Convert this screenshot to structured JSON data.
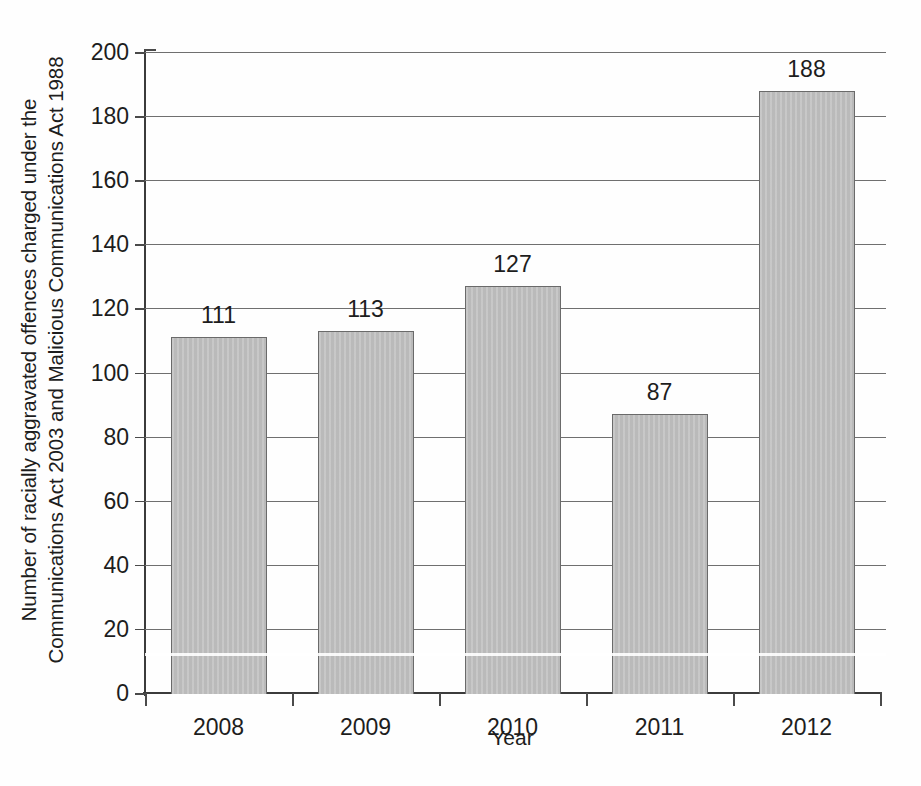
{
  "chart_data": {
    "type": "bar",
    "title": "",
    "categories": [
      "2008",
      "2009",
      "2010",
      "2011",
      "2012"
    ],
    "values": [
      111,
      113,
      127,
      87,
      188
    ],
    "data_labels": [
      "111",
      "113",
      "127",
      "87",
      "188"
    ],
    "xlabel": "Year",
    "ylabel_lines": [
      "Number of racially aggravated offences charged under the",
      "Communications Act 2003 and Malicious Communications Act 1988"
    ],
    "ylabel": "Number of racially aggravated offences charged under the Communications Act 2003 and Malicious Communications Act 1988",
    "ylim": [
      0,
      200
    ],
    "ytick_step": 20,
    "ytick_labels": [
      "0",
      "20",
      "40",
      "60",
      "80",
      "100",
      "120",
      "140",
      "160",
      "180",
      "200"
    ],
    "ytick_values": [
      0,
      20,
      40,
      60,
      80,
      100,
      120,
      140,
      160,
      180,
      200
    ],
    "grid": true,
    "grid_axis": "y",
    "legend": false,
    "legend_position": "none",
    "bar_color": "#bdbdbd",
    "bar_edge_color": "#6a6a6a",
    "axis_color": "#3b3b3b",
    "grid_color": "#6f6f6f",
    "text_color": "#1d1d1d",
    "background_color": "#ffffff"
  }
}
